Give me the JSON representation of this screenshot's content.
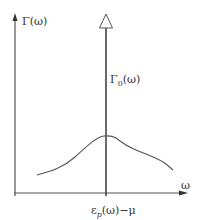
{
  "diagram": {
    "title": "",
    "y_axis_label": "Γ(ω)",
    "x_axis_label": "ω",
    "delta_peak_label": {
      "base": "Γ",
      "subscript": "0",
      "suffix": "(ω)"
    },
    "x_marker_label": {
      "base": "ε",
      "subscript": "p",
      "suffix": "(ω)−μ"
    },
    "colors": {
      "axis": "#555555",
      "curve": "#555555",
      "text": "#333333",
      "background": "#ffffff"
    },
    "elements": [
      {
        "type": "axis",
        "name": "y-axis",
        "from": [
          15,
          195
        ],
        "to": [
          15,
          14
        ],
        "arrow": "filled"
      },
      {
        "type": "axis",
        "name": "x-axis",
        "from": [
          15,
          193
        ],
        "to": [
          186,
          193
        ],
        "arrow": "filled"
      },
      {
        "type": "line",
        "name": "delta-peak",
        "from": [
          106,
          195
        ],
        "to": [
          106,
          28
        ],
        "arrow": "open-triangle"
      },
      {
        "type": "curve",
        "name": "broad-spectral-curve",
        "points": [
          [
            37,
            175
          ],
          [
            60,
            168
          ],
          [
            80,
            152
          ],
          [
            95,
            140
          ],
          [
            107,
            137
          ],
          [
            115,
            138
          ],
          [
            128,
            147
          ],
          [
            150,
            157
          ],
          [
            165,
            165
          ],
          [
            173,
            170
          ]
        ]
      }
    ]
  }
}
